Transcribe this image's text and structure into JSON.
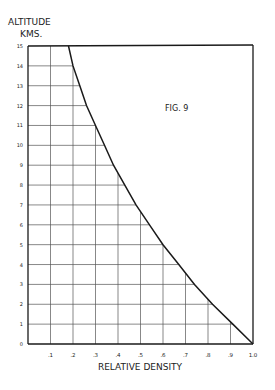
{
  "chart_data": {
    "type": "line",
    "title": "FIG. 9",
    "xlabel": "RELATIVE DENSITY",
    "ylabel": "ALTITUDE KMS.",
    "ylabel_line1": "ALTITUDE",
    "ylabel_line2": "KMS.",
    "xlim": [
      0,
      1.0
    ],
    "ylim": [
      0,
      15
    ],
    "x_ticks": [
      ".1",
      ".2",
      ".3",
      ".4",
      ".5",
      ".6",
      ".7",
      ".8",
      ".9",
      "1.0"
    ],
    "y_ticks": [
      "0",
      "1",
      "2",
      "3",
      "4",
      "5",
      "6",
      "7",
      "8",
      "9",
      "10",
      "11",
      "12",
      "13",
      "14",
      "15"
    ],
    "grid": "shown only beneath curve",
    "legend": null,
    "series": [
      {
        "name": "Relative density vs altitude",
        "x": [
          1.0,
          0.91,
          0.82,
          0.74,
          0.67,
          0.6,
          0.54,
          0.48,
          0.43,
          0.38,
          0.34,
          0.3,
          0.26,
          0.23,
          0.2,
          0.18
        ],
        "y": [
          0,
          1,
          2,
          3,
          4,
          5,
          6,
          7,
          8,
          9,
          10,
          11,
          12,
          13,
          14,
          15
        ]
      }
    ]
  }
}
